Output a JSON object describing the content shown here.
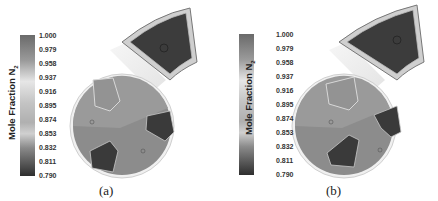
{
  "figure": {
    "panels": [
      {
        "id": "a",
        "caption": "(a)",
        "colorbar": {
          "label": "Mole Fraction N",
          "label_subscript": "2",
          "ticks": [
            "1.000",
            "0.979",
            "0.958",
            "0.937",
            "0.916",
            "0.895",
            "0.874",
            "0.853",
            "0.832",
            "0.811",
            "0.790"
          ]
        }
      },
      {
        "id": "b",
        "caption": "(b)",
        "colorbar": {
          "label": "Mole Fraction N",
          "label_subscript": "2",
          "ticks": [
            "1.000",
            "0.979",
            "0.958",
            "0.937",
            "0.916",
            "0.895",
            "0.874",
            "0.853",
            "0.832",
            "0.811",
            "0.790"
          ]
        }
      }
    ],
    "colors": {
      "background": "#ffffff",
      "disc_fill": "#8a8a8a",
      "dark_region": "#3a3a3a",
      "light_region": "#9a9a9a",
      "rim": "#d8d8d8"
    }
  }
}
